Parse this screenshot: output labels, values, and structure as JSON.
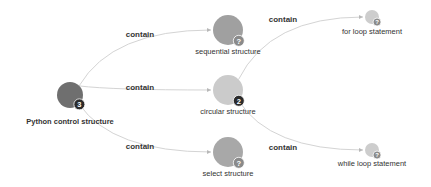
{
  "diagram": {
    "type": "mind-map",
    "colors": {
      "edge": "#d4d4d4",
      "edge_label": "#333333",
      "node_label": "#333333",
      "badge_dark": "#2b2b2b",
      "badge_grey": "#8a8a8a"
    },
    "nodes": [
      {
        "id": "root",
        "label": "Python control structure",
        "bold": true,
        "x": 70,
        "y": 95,
        "r": 13,
        "fill": "#6f6f6f",
        "badge": "3",
        "badge_color": "#2b2b2b",
        "label_y": 124
      },
      {
        "id": "sequential",
        "label": "sequential structure",
        "bold": false,
        "x": 228,
        "y": 30,
        "r": 15,
        "fill": "#a0a0a0",
        "badge": "?",
        "badge_color": "#8a8a8a",
        "label_y": 54
      },
      {
        "id": "circular",
        "label": "circular structure",
        "bold": false,
        "x": 228,
        "y": 90,
        "r": 15,
        "fill": "#cbcbcb",
        "badge": "2",
        "badge_color": "#2b2b2b",
        "label_y": 114
      },
      {
        "id": "select",
        "label": "select structure",
        "bold": false,
        "x": 228,
        "y": 152,
        "r": 15,
        "fill": "#a8a8a8",
        "badge": "?",
        "badge_color": "#8a8a8a",
        "label_y": 176
      },
      {
        "id": "forloop",
        "label": "for loop statement",
        "bold": false,
        "x": 372,
        "y": 17,
        "r": 7,
        "fill": "#cdcdcd",
        "badge": "?",
        "badge_color": "#8a8a8a",
        "label_y": 34
      },
      {
        "id": "whileloop",
        "label": "while loop statement",
        "bold": false,
        "x": 372,
        "y": 150,
        "r": 7,
        "fill": "#cdcdcd",
        "badge": "?",
        "badge_color": "#8a8a8a",
        "label_y": 166
      }
    ],
    "edges": [
      {
        "from": "root",
        "to": "sequential",
        "label": "contain",
        "label_x": 140,
        "label_y": 37
      },
      {
        "from": "root",
        "to": "circular",
        "label": "contain",
        "label_x": 140,
        "label_y": 90
      },
      {
        "from": "root",
        "to": "select",
        "label": "contain",
        "label_x": 140,
        "label_y": 149
      },
      {
        "from": "circular",
        "to": "forloop",
        "label": "contain",
        "label_x": 283,
        "label_y": 22
      },
      {
        "from": "circular",
        "to": "whileloop",
        "label": "contain",
        "label_x": 283,
        "label_y": 150
      }
    ]
  }
}
